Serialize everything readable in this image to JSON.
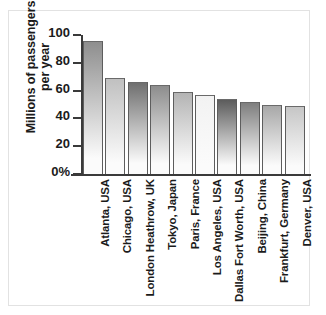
{
  "chart_data": {
    "type": "bar",
    "title": "",
    "subtitle": "",
    "xlabel": "",
    "ylabel": "Millions of passengers per year",
    "ylabel_lines": [
      "Millions of passengers",
      "per year"
    ],
    "categories": [
      "Atlanta, USA",
      "Chicago, USA",
      "London Heathrow, UK",
      "Tokyo, Japan",
      "Paris, France",
      "Los Angeles, USA",
      "Dallas Fort Worth, USA",
      "Beijing, China",
      "Frankfurt, Germany",
      "Denver, USA"
    ],
    "values": [
      96,
      69,
      66,
      64,
      59,
      57,
      54,
      52,
      50,
      49
    ],
    "ylim": [
      0,
      100
    ],
    "yticks": [
      0,
      20,
      40,
      60,
      80,
      100
    ],
    "ytick_labels": [
      "0%",
      "20",
      "40",
      "60",
      "80",
      "100"
    ],
    "grid": false,
    "legend": false,
    "legend_position": "none",
    "bar_top_colors": [
      "#8e8e8e",
      "#c0c0c0",
      "#6f6f6f",
      "#8d8d8d",
      "#b4b4b4",
      "#f2f2f2",
      "#5c5c5c",
      "#7e7e7e",
      "#a8a8a8",
      "#c6c6c6"
    ],
    "bar_bottom_color": "#fbfbfb",
    "axis_color": "#3a3a3a",
    "text_color": "#1b1b1b",
    "background_color": "#ffffff",
    "border_color": "#e2e2e2"
  }
}
